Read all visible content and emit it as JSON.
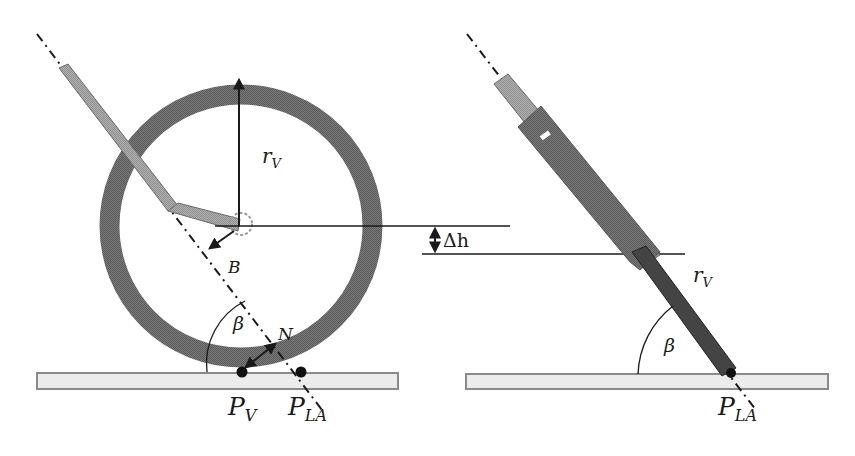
{
  "colors": {
    "wheel_ring": "#6e6e6e",
    "arm_light": "#a8a8a8",
    "arm_dark": "#5c5c5c",
    "ground_fill": "#ececec",
    "ground_stroke": "#8a8a8a",
    "ink": "#1a1a1a"
  },
  "left_view": {
    "labels": {
      "radius": "r",
      "radius_sub": "V",
      "pivot": "B",
      "normal": "N",
      "angle": "β",
      "wheel_contact": "P",
      "wheel_contact_sub": "V",
      "arm_contact": "P",
      "arm_contact_sub": "LA"
    }
  },
  "middle": {
    "labels": {
      "height_diff": "Δh"
    }
  },
  "right_view": {
    "labels": {
      "radius": "r",
      "radius_sub": "V",
      "angle": "β",
      "arm_contact": "P",
      "arm_contact_sub": "LA"
    }
  }
}
